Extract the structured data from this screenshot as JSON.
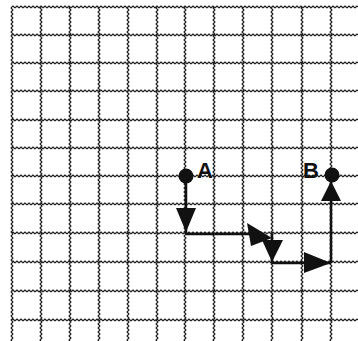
{
  "diagram": {
    "type": "grid-path",
    "grid": {
      "columns": 12,
      "rows": 12,
      "vertical_lines_x": [
        12,
        41,
        70,
        99,
        128,
        157,
        185,
        214,
        243,
        272,
        302,
        331
      ],
      "horizontal_lines_y": [
        7,
        35,
        63,
        91,
        120,
        148,
        176,
        204,
        233,
        262,
        291,
        320
      ],
      "line_style": "wavy",
      "line_color": "#222222"
    },
    "points": [
      {
        "label": "A",
        "x": 186,
        "y": 176
      },
      {
        "label": "B",
        "x": 331,
        "y": 176
      }
    ],
    "path": {
      "description": "From A: down 2 units, right 3 units, down 1 unit, right 2 units, up 3 units to B",
      "segments": [
        {
          "direction": "down",
          "from": [
            186,
            176
          ],
          "to": [
            186,
            233
          ]
        },
        {
          "direction": "right",
          "from": [
            186,
            233
          ],
          "to": [
            272,
            233
          ]
        },
        {
          "direction": "down",
          "from": [
            272,
            233
          ],
          "to": [
            272,
            262
          ]
        },
        {
          "direction": "right",
          "from": [
            272,
            262
          ],
          "to": [
            331,
            262
          ]
        },
        {
          "direction": "up",
          "from": [
            331,
            262
          ],
          "to": [
            331,
            176
          ]
        }
      ],
      "color": "#111111"
    },
    "labels": {
      "point_a": "A",
      "point_b": "B"
    }
  }
}
